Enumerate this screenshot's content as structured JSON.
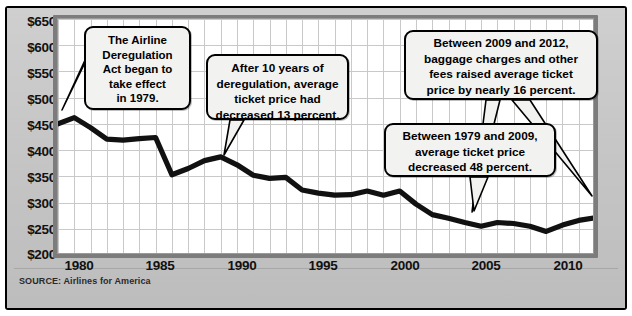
{
  "title": "",
  "source_note": "SOURCE: Airlines for America",
  "axis": {
    "y_ticks": [
      "$650",
      "$600",
      "$550",
      "$500",
      "$450",
      "$400",
      "$350",
      "$300",
      "$250",
      "$200"
    ],
    "x_ticks": [
      "1980",
      "1985",
      "1990",
      "1995",
      "2000",
      "2005",
      "2010"
    ]
  },
  "callouts": [
    {
      "id": "deregulation-act",
      "lines": [
        "The Airline",
        "Deregulation",
        "Act began to",
        "take effect",
        "in 1979."
      ]
    },
    {
      "id": "ten-years-after",
      "lines": [
        "After 10 years of",
        "deregulation, average",
        "ticket price had",
        "decreased 13 percent."
      ]
    },
    {
      "id": "baggage-fees",
      "lines": [
        "Between 2009 and 2012,",
        "baggage charges and other",
        "fees raised average ticket",
        "price by nearly 16 percent."
      ]
    },
    {
      "id": "long-run-decline",
      "lines": [
        "Between 1979 and 2009,",
        "average ticket price",
        "decreased 48 percent."
      ]
    }
  ],
  "colors": {
    "frame": "#c6c6c6",
    "plot_background": "#ffffff",
    "gridline": "#c9c9c9",
    "data_line": "#111111",
    "callout_background": "#f2f2f0",
    "callout_border": "#000000"
  },
  "chart_data": {
    "type": "line",
    "xlabel": "",
    "ylabel": "",
    "xlim": [
      1979,
      2012
    ],
    "ylim": [
      200,
      650
    ],
    "grid": true,
    "legend": "none",
    "y_tick_values": [
      200,
      250,
      300,
      350,
      400,
      450,
      500,
      550,
      600,
      650
    ],
    "x_tick_values": [
      1980,
      1985,
      1990,
      1995,
      2000,
      2005,
      2010
    ],
    "series": [
      {
        "name": "Average ticket price (inflation adjusted, U.S. dollars)",
        "x": [
          1979,
          1980,
          1981,
          1982,
          1983,
          1984,
          1985,
          1986,
          1987,
          1988,
          1989,
          1990,
          1991,
          1992,
          1993,
          1994,
          1995,
          1996,
          1997,
          1998,
          1999,
          2000,
          2001,
          2002,
          2003,
          2004,
          2005,
          2006,
          2007,
          2008,
          2009,
          2010,
          2011,
          2012
        ],
        "values": [
          450,
          462,
          443,
          421,
          419,
          422,
          424,
          353,
          365,
          380,
          387,
          372,
          352,
          346,
          348,
          324,
          318,
          314,
          315,
          322,
          314,
          322,
          297,
          277,
          270,
          262,
          255,
          262,
          260,
          255,
          245,
          257,
          266,
          271
        ]
      }
    ],
    "annotations": [
      "The Airline Deregulation Act began to take effect in 1979.",
      "After 10 years of deregulation, average ticket price had decreased 13 percent.",
      "Between 2009 and 2012, baggage charges and other fees raised average ticket price by nearly 16 percent.",
      "Between 1979 and 2009, average ticket price decreased 48 percent."
    ]
  }
}
